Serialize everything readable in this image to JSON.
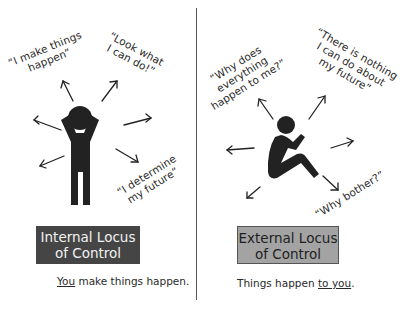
{
  "internal": {
    "quotes": [
      {
        "line1": "“I make things",
        "line2": "happen”"
      },
      {
        "line1": "“Look what",
        "line2": "I can do!”"
      },
      {
        "line1": "“I determine",
        "line2": "my future”"
      }
    ],
    "box": {
      "line1": "Internal Locus",
      "line2": "of Control"
    },
    "caption": {
      "emphasis": "You",
      "rest": " make things happen."
    },
    "figure": "standing-person-arms-raised-icon",
    "colors": {
      "box_bg": "#454545",
      "box_text": "#f2f2f2",
      "figure": "#222222"
    }
  },
  "external": {
    "quotes": [
      {
        "line1": "“Why does",
        "line2": "everything",
        "line3": "happen to me?”"
      },
      {
        "line1": "“There is nothing",
        "line2": "I can do about",
        "line3": "my future”"
      },
      {
        "line1": "“Why bother?”"
      }
    ],
    "box": {
      "line1": "External Locus",
      "line2": "of Control"
    },
    "caption": {
      "rest": "Things happen ",
      "emphasis": "to you",
      "end": "."
    },
    "figure": "seated-person-hugging-knees-icon",
    "colors": {
      "box_bg": "#a3a3a3",
      "box_text": "#1e1e1e",
      "figure": "#222222"
    }
  },
  "divider_color": "#555555"
}
